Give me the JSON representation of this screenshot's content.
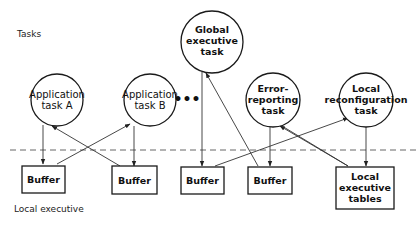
{
  "labels": {
    "tasks": "Tasks",
    "local_executive": "Local executive",
    "ellipsis": "•••"
  },
  "tasks": {
    "global_executive": {
      "line1": "Global",
      "line2": "executive",
      "line3": "task"
    },
    "application_a": {
      "line1": "Application",
      "line2": "task A"
    },
    "application_b": {
      "line1": "Application",
      "line2": "task B"
    },
    "error_reporting": {
      "line1": "Error-",
      "line2": "reporting",
      "line3": "task"
    },
    "local_reconfiguration": {
      "line1": "Local",
      "line2": "reconfiguration",
      "line3": "task"
    }
  },
  "buffers": [
    {
      "label": "Buffer"
    },
    {
      "label": "Buffer"
    },
    {
      "label": "Buffer"
    },
    {
      "label": "Buffer"
    }
  ],
  "local_executive_tables": {
    "line1": "Local",
    "line2": "executive",
    "line3": "tables"
  },
  "edges": [
    {
      "from": "Application task A",
      "to": "Buffer 1"
    },
    {
      "from": "Buffer 1",
      "to": "Application task B"
    },
    {
      "from": "Buffer 2",
      "to": "Application task A"
    },
    {
      "from": "Application task B",
      "to": "Buffer 2"
    },
    {
      "from": "Global executive task",
      "to": "Buffer 3"
    },
    {
      "from": "Buffer 4",
      "to": "Global executive task"
    },
    {
      "from": "Buffer 3",
      "to": "Local reconfiguration task"
    },
    {
      "from": "Error-reporting task",
      "to": "Buffer 4"
    },
    {
      "from": "Local executive tables",
      "to": "Error-reporting task"
    },
    {
      "from": "Local reconfiguration task",
      "to": "Local executive tables"
    }
  ]
}
